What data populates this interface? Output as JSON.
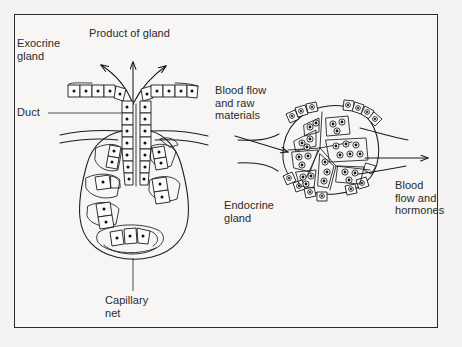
{
  "figure": {
    "title_visible": false,
    "background_color": "#f4f3f1",
    "frame_color": "#2b2b2b",
    "ink_color": "#1a1a1a",
    "text_color": "#2a2a2a"
  },
  "labels": {
    "exocrine_gland": "Exocrine\ngland",
    "product_of_gland": "Product of gland",
    "duct": "Duct",
    "capillary_net": "Capillary\nnet",
    "blood_flow_raw_materials": "Blood flow\nand raw\nmaterials",
    "endocrine_gland": "Endocrine\ngland",
    "blood_flow_hormones": "Blood\nflow and\nhormones"
  },
  "diagram": {
    "type": "biology-illustration",
    "panels": [
      {
        "name": "exocrine-gland",
        "side": "left",
        "features": [
          "secretory acinus (flask-shaped cluster of secretory cells)",
          "duct lined with cuboidal epithelial cells",
          "duct opening at epithelial surface",
          "three curved arrows showing product released to surface",
          "surrounding capillary net",
          "surface epithelium rows flanking the duct"
        ],
        "arrow_count": 3,
        "arrow_direction": "outward-up"
      },
      {
        "name": "endocrine-gland",
        "side": "right",
        "features": [
          "rounded gland body with no duct",
          "internal cell clusters separated by septa",
          "peripheral capsule cells",
          "incoming blood vessel with arrow",
          "outgoing blood vessel with arrow"
        ],
        "arrow_count": 2,
        "inflow_arrow_direction": "right",
        "outflow_arrow_direction": "right"
      }
    ]
  }
}
